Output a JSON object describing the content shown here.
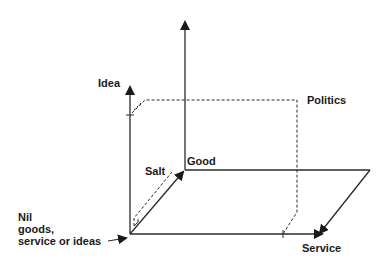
{
  "diagram": {
    "type": "3d-axes",
    "colors": {
      "line": "#2a2a2a",
      "text": "#1a1a1a",
      "background": "#ffffff"
    },
    "labels": {
      "idea": "Idea",
      "politics": "Politics",
      "salt": "Salt",
      "good": "Good",
      "nil_line1": "Nil",
      "nil_line2": "goods,",
      "nil_line3": "service or ideas",
      "service": "Service"
    },
    "axes": [
      {
        "name": "Idea",
        "direction": "up"
      },
      {
        "name": "Good",
        "direction": "diagonal-back"
      },
      {
        "name": "Service",
        "direction": "right"
      }
    ],
    "points": [
      {
        "name": "Nil goods, service or ideas",
        "position": "origin"
      },
      {
        "name": "Salt",
        "position": "near Good axis"
      },
      {
        "name": "Politics",
        "position": "Idea + Service plane"
      }
    ]
  }
}
